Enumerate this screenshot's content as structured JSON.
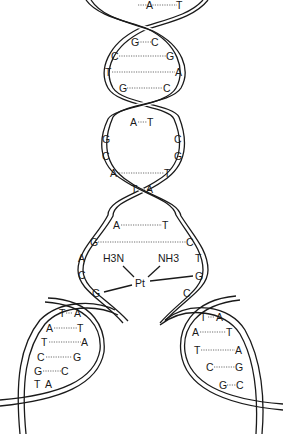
{
  "diagram": {
    "complex": {
      "metal": "Pt",
      "ligand_left": "H3N",
      "ligand_right": "NH3",
      "bound_left_base": "G",
      "bound_right_base": "G"
    },
    "helix_pairs": [
      {
        "left": "A",
        "right": "T",
        "x1": 151,
        "x2": 181,
        "y": 5
      },
      {
        "left": "G",
        "right": "C",
        "x1": 134,
        "x2": 154,
        "y": 43
      },
      {
        "left": "C",
        "right": "G",
        "x1": 113,
        "x2": 169,
        "y": 57
      },
      {
        "left": "T",
        "right": "A",
        "x1": 107,
        "x2": 178,
        "y": 72
      },
      {
        "left": "G",
        "right": "C",
        "x1": 121,
        "x2": 165,
        "y": 89
      },
      {
        "left": "A",
        "right": "T",
        "x1": 133,
        "x2": 150,
        "y": 122
      },
      {
        "left": "G",
        "right": "C",
        "x1": 105,
        "x2": 175,
        "y": 139
      },
      {
        "left": "C",
        "right": "G",
        "x1": 105,
        "x2": 175,
        "y": 157
      },
      {
        "left": "A",
        "right": "T",
        "x1": 113,
        "x2": 167,
        "y": 173
      },
      {
        "left": "T",
        "right": "A",
        "x1": 134,
        "x2": 148,
        "y": 189
      },
      {
        "left": "A",
        "right": "T",
        "x1": 116,
        "x2": 164,
        "y": 225
      },
      {
        "left": "G",
        "right": "C",
        "x1": 93,
        "x2": 189,
        "y": 242
      }
    ],
    "unpaired_left": [
      {
        "base": "A",
        "x": 81,
        "y": 259
      },
      {
        "base": "C",
        "x": 81,
        "y": 275
      },
      {
        "base": "G",
        "x": 95,
        "y": 293
      }
    ],
    "unpaired_right": [
      {
        "base": "T",
        "x": 197,
        "y": 259
      },
      {
        "base": "G",
        "x": 197,
        "y": 276
      },
      {
        "base": "C",
        "x": 186,
        "y": 293
      }
    ],
    "left_loop_pairs": [
      {
        "left": "T",
        "right": "A",
        "x1": 61,
        "x2": 77,
        "y": 314
      },
      {
        "left": "A",
        "right": "T",
        "x1": 48,
        "x2": 80,
        "y": 329
      },
      {
        "left": "T",
        "right": "A",
        "x1": 42,
        "x2": 84,
        "y": 343
      },
      {
        "left": "C",
        "right": "G",
        "x1": 38,
        "x2": 76,
        "y": 358
      },
      {
        "left": "G",
        "right": "C",
        "x1": 35,
        "x2": 64,
        "y": 371
      },
      {
        "left": "T",
        "right": "A",
        "x1": 35,
        "x2": 48,
        "y": 384
      }
    ],
    "right_loop_pairs": [
      {
        "left": "T",
        "right": "A",
        "x1": 203,
        "x2": 219,
        "y": 318
      },
      {
        "left": "A",
        "right": "T",
        "x1": 194,
        "x2": 229,
        "y": 332
      },
      {
        "left": "T",
        "right": "A",
        "x1": 196,
        "x2": 238,
        "y": 350
      },
      {
        "left": "C",
        "right": "G",
        "x1": 208,
        "x2": 238,
        "y": 367
      },
      {
        "left": "G",
        "right": "C",
        "x1": 222,
        "x2": 240,
        "y": 385
      }
    ]
  }
}
